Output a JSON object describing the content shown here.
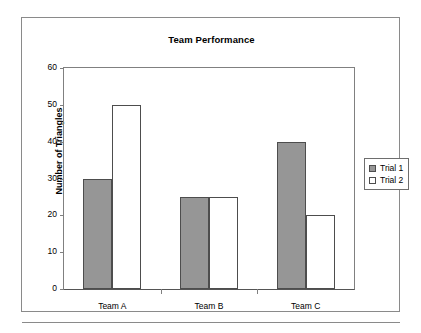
{
  "chart_data": {
    "type": "bar",
    "title": "Team Performance",
    "xlabel": "",
    "ylabel": "Number of Triangles",
    "categories": [
      "Team A",
      "Team B",
      "Team C"
    ],
    "series": [
      {
        "name": "Trial 1",
        "values": [
          30,
          25,
          40
        ],
        "color": "#969696"
      },
      {
        "name": "Trial 2",
        "values": [
          50,
          25,
          20
        ],
        "color": "#ffffff"
      }
    ],
    "ylim": [
      0,
      60
    ],
    "yticks": [
      0,
      10,
      20,
      30,
      40,
      50,
      60
    ],
    "ytick_labels": [
      "0",
      "10",
      "20",
      "30",
      "40",
      "50",
      "60"
    ],
    "grid": false,
    "legend_position": "right"
  },
  "figure": {
    "border_color": "#8a8a8a",
    "axis_color": "#808080",
    "bar_outline_color": "#4d4d4d",
    "background": "#ffffff"
  }
}
